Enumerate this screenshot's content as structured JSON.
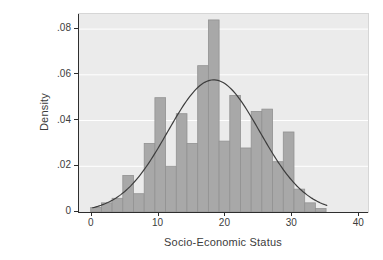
{
  "figure": {
    "x_axis_title": "Socio-Economic Status",
    "y_axis_title": "Density"
  },
  "chart_data": {
    "type": "bar",
    "subtype": "histogram-with-normal-density-overlay",
    "title": "",
    "xlabel": "Socio-Economic Status",
    "ylabel": "Density",
    "x_tick_labels": [
      "0",
      "10",
      "20",
      "30",
      "40"
    ],
    "x_tick_values": [
      0,
      10,
      20,
      30,
      40
    ],
    "y_tick_labels": [
      "0",
      ".02",
      ".04",
      ".06",
      ".08"
    ],
    "y_tick_values": [
      0,
      0.02,
      0.04,
      0.06,
      0.08
    ],
    "x_range_shown": [
      -1.9,
      41.47
    ],
    "ylim": [
      0,
      0.0866
    ],
    "grid": "horizontal white gridlines at each y tick",
    "legend": "none",
    "bins": {
      "start": 0,
      "width": 1.6,
      "heights": [
        0.002,
        0.004,
        0.006,
        0.016,
        0.008,
        0.03,
        0.05,
        0.02,
        0.043,
        0.03,
        0.064,
        0.084,
        0.031,
        0.051,
        0.028,
        0.044,
        0.045,
        0.022,
        0.035,
        0.01,
        0.004,
        0.0015
      ]
    },
    "overlay_curve": {
      "shape": "normal-density",
      "mean": 18.4,
      "sd": 6.9,
      "peak_density": 0.0578,
      "x_start": 0.3,
      "x_end": 35.4
    },
    "colors": {
      "bar_fill": "#a8a8a8",
      "bar_border": "#929292",
      "plot_background": "#ebebeb",
      "gridline": "#ffffff",
      "curve": "#3d3d3d",
      "axis": "#2e2e2e",
      "text": "#3c3c3c",
      "page_background": "#ffffff"
    }
  }
}
